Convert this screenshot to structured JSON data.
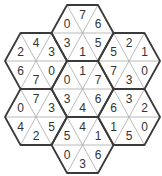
{
  "puzzle": {
    "triangle_order": [
      "upper-left",
      "top",
      "upper-right",
      "lower-left",
      "bottom",
      "lower-right"
    ],
    "hexes": [
      {
        "name": "top",
        "values": [
          "0",
          "7",
          "6",
          "3",
          "1",
          "5"
        ]
      },
      {
        "name": "upper-left",
        "values": [
          "2",
          "4",
          "3",
          "6",
          "7",
          "0"
        ]
      },
      {
        "name": "upper-right",
        "values": [
          "5",
          "2",
          "1",
          "7",
          "3",
          "0"
        ]
      },
      {
        "name": "center",
        "values": [
          "0",
          "1",
          "7",
          "3",
          "4",
          "6"
        ]
      },
      {
        "name": "lower-left",
        "values": [
          "0",
          "7",
          "3",
          "4",
          "2",
          "5"
        ]
      },
      {
        "name": "lower-right",
        "values": [
          "6",
          "3",
          "2",
          "1",
          "5",
          "0"
        ]
      },
      {
        "name": "bottom",
        "values": [
          "5",
          "4",
          "1",
          "0",
          "3",
          "6"
        ]
      }
    ]
  },
  "colors": {
    "background": "#ffffff",
    "outline": "#3a3a3a",
    "divider": "#a8a8a8",
    "digit": "#333333"
  }
}
